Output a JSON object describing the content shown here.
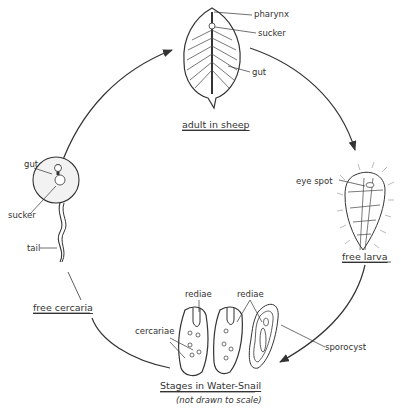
{
  "diagram": {
    "type": "life-cycle",
    "stages": [
      {
        "id": "adult",
        "title": "adult in sheep",
        "labels": [
          "pharynx",
          "sucker",
          "gut"
        ]
      },
      {
        "id": "larva",
        "title": "free larva",
        "labels": [
          "eye spot"
        ]
      },
      {
        "id": "snail",
        "title": "Stages in Water-Snail",
        "subtitle": "(not drawn to scale)",
        "labels": [
          "rediae",
          "rediae",
          "cercariae",
          "sporocyst"
        ]
      },
      {
        "id": "cercaria",
        "title": "free cercaria",
        "labels": [
          "gut",
          "sucker",
          "tail"
        ]
      }
    ],
    "flow": [
      "adult in sheep",
      "free larva",
      "Stages in Water-Snail",
      "free cercaria",
      "adult in sheep"
    ]
  },
  "colors": {
    "ink": "#333333",
    "background": "#ffffff"
  }
}
